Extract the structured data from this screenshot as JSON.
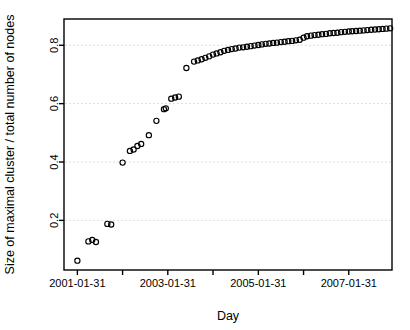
{
  "chart_data": {
    "type": "scatter",
    "title": "",
    "subtitle": "",
    "xlabel": "Day",
    "ylabel": "Size of maximal cluster / total number of nodes",
    "xlim": [
      "2000-10-15",
      "2008-01-15"
    ],
    "ylim": [
      0.03,
      0.89
    ],
    "grid": true,
    "grid_axis": "y",
    "grid_style": "dashed",
    "legend": null,
    "legend_position": "none",
    "marker": "open-circle",
    "marker_color": "#000000",
    "marker_fill": "none",
    "x_tick_labels": [
      "2001-01-31",
      "2003-01-31",
      "2005-01-31",
      "2007-01-31"
    ],
    "x_tick_values": [
      "2001-01-31",
      "2003-01-31",
      "2005-01-31",
      "2007-01-31"
    ],
    "x_minor_tick_values": [
      "2002-01-31",
      "2004-01-31",
      "2006-01-31",
      "2008-01-31"
    ],
    "y_tick_labels": [
      "0.2",
      "0.4",
      "0.6",
      "0.8"
    ],
    "y_tick_values": [
      0.2,
      0.4,
      0.6,
      0.8
    ],
    "points": [
      {
        "x": "2001-01-31",
        "y": 0.062
      },
      {
        "x": "2001-04-30",
        "y": 0.128
      },
      {
        "x": "2001-05-31",
        "y": 0.133
      },
      {
        "x": "2001-06-30",
        "y": 0.126
      },
      {
        "x": "2001-09-30",
        "y": 0.188
      },
      {
        "x": "2001-10-31",
        "y": 0.186
      },
      {
        "x": "2002-01-31",
        "y": 0.398
      },
      {
        "x": "2002-03-31",
        "y": 0.438
      },
      {
        "x": "2002-04-30",
        "y": 0.443
      },
      {
        "x": "2002-05-31",
        "y": 0.455
      },
      {
        "x": "2002-06-30",
        "y": 0.462
      },
      {
        "x": "2002-08-31",
        "y": 0.492
      },
      {
        "x": "2002-10-31",
        "y": 0.541
      },
      {
        "x": "2002-12-31",
        "y": 0.581
      },
      {
        "x": "2003-01-15",
        "y": 0.584
      },
      {
        "x": "2003-02-28",
        "y": 0.617
      },
      {
        "x": "2003-03-31",
        "y": 0.621
      },
      {
        "x": "2003-04-30",
        "y": 0.624
      },
      {
        "x": "2003-06-30",
        "y": 0.722
      },
      {
        "x": "2003-08-31",
        "y": 0.744
      },
      {
        "x": "2003-09-30",
        "y": 0.748
      },
      {
        "x": "2003-10-31",
        "y": 0.752
      },
      {
        "x": "2003-11-30",
        "y": 0.757
      },
      {
        "x": "2003-12-31",
        "y": 0.762
      },
      {
        "x": "2004-01-31",
        "y": 0.768
      },
      {
        "x": "2004-02-29",
        "y": 0.772
      },
      {
        "x": "2004-03-31",
        "y": 0.776
      },
      {
        "x": "2004-04-30",
        "y": 0.781
      },
      {
        "x": "2004-05-31",
        "y": 0.784
      },
      {
        "x": "2004-06-30",
        "y": 0.787
      },
      {
        "x": "2004-07-31",
        "y": 0.789
      },
      {
        "x": "2004-08-31",
        "y": 0.792
      },
      {
        "x": "2004-09-30",
        "y": 0.793
      },
      {
        "x": "2004-10-31",
        "y": 0.795
      },
      {
        "x": "2004-11-30",
        "y": 0.797
      },
      {
        "x": "2004-12-31",
        "y": 0.799
      },
      {
        "x": "2005-01-31",
        "y": 0.801
      },
      {
        "x": "2005-02-28",
        "y": 0.803
      },
      {
        "x": "2005-03-31",
        "y": 0.805
      },
      {
        "x": "2005-04-30",
        "y": 0.806
      },
      {
        "x": "2005-05-31",
        "y": 0.808
      },
      {
        "x": "2005-06-30",
        "y": 0.809
      },
      {
        "x": "2005-07-31",
        "y": 0.811
      },
      {
        "x": "2005-08-31",
        "y": 0.812
      },
      {
        "x": "2005-09-30",
        "y": 0.814
      },
      {
        "x": "2005-10-31",
        "y": 0.815
      },
      {
        "x": "2005-11-30",
        "y": 0.817
      },
      {
        "x": "2005-12-31",
        "y": 0.819
      },
      {
        "x": "2006-01-31",
        "y": 0.826
      },
      {
        "x": "2006-02-28",
        "y": 0.831
      },
      {
        "x": "2006-03-31",
        "y": 0.833
      },
      {
        "x": "2006-04-30",
        "y": 0.835
      },
      {
        "x": "2006-05-31",
        "y": 0.836
      },
      {
        "x": "2006-06-30",
        "y": 0.838
      },
      {
        "x": "2006-07-31",
        "y": 0.839
      },
      {
        "x": "2006-08-31",
        "y": 0.841
      },
      {
        "x": "2006-09-30",
        "y": 0.842
      },
      {
        "x": "2006-10-31",
        "y": 0.843
      },
      {
        "x": "2006-11-30",
        "y": 0.845
      },
      {
        "x": "2006-12-31",
        "y": 0.846
      },
      {
        "x": "2007-01-31",
        "y": 0.847
      },
      {
        "x": "2007-02-28",
        "y": 0.848
      },
      {
        "x": "2007-03-31",
        "y": 0.849
      },
      {
        "x": "2007-04-30",
        "y": 0.85
      },
      {
        "x": "2007-05-31",
        "y": 0.851
      },
      {
        "x": "2007-06-30",
        "y": 0.852
      },
      {
        "x": "2007-07-31",
        "y": 0.853
      },
      {
        "x": "2007-08-31",
        "y": 0.854
      },
      {
        "x": "2007-09-30",
        "y": 0.855
      },
      {
        "x": "2007-10-31",
        "y": 0.856
      },
      {
        "x": "2007-11-30",
        "y": 0.857
      },
      {
        "x": "2007-12-31",
        "y": 0.858
      }
    ]
  },
  "figure": {
    "background_color": "#ffffff",
    "axis_color": "#000000",
    "grid_color": "#d9d9d9",
    "plot_area": {
      "left": 64,
      "top": 19,
      "right": 392,
      "bottom": 270
    }
  }
}
